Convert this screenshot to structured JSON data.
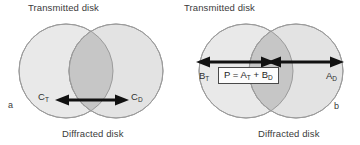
{
  "figure": {
    "width": 360,
    "height": 145,
    "background": "#ffffff"
  },
  "colors": {
    "disk_fill": "#e8e8e8",
    "disk_fill_right": "#e2e2e2",
    "overlap_fill": "#c4c4c4",
    "disk_stroke": "#9a9a9a",
    "arrow": "#111111",
    "text": "#333333",
    "box_border": "#4a4a4a",
    "box_fill": "#fdfdfd"
  },
  "panels": [
    {
      "id": "a",
      "letter": "a",
      "top_label": "Transmitted disk",
      "bottom_label": "Diffracted disk",
      "labels": {
        "left": {
          "base": "C",
          "sub": "T"
        },
        "right": {
          "base": "C",
          "sub": "D"
        }
      },
      "geometry": {
        "left_circle": {
          "cx": 66,
          "cy": 71,
          "r": 47
        },
        "right_circle": {
          "cx": 116,
          "cy": 71,
          "r": 47
        },
        "arrow": {
          "x1": 62,
          "x2": 122,
          "y": 100
        }
      }
    },
    {
      "id": "b",
      "letter": "b",
      "top_label": "Transmitted disk",
      "bottom_label": "Diffracted disk",
      "labels": {
        "left": {
          "base": "B",
          "sub": "T"
        },
        "right": {
          "base": "A",
          "sub": "D"
        }
      },
      "formula": {
        "lhs": "P",
        "eq": "=",
        "term1_base": "A",
        "term1_sub": "T",
        "plus": "+",
        "term2_base": "B",
        "term2_sub": "D"
      },
      "geometry": {
        "left_circle": {
          "cx": 66,
          "cy": 71,
          "r": 47
        },
        "right_circle": {
          "cx": 116,
          "cy": 71,
          "r": 47
        },
        "arrow_left": {
          "x1": 22,
          "x2": 91,
          "y": 62
        },
        "arrow_right": {
          "x1": 93,
          "x2": 160,
          "y": 62
        }
      }
    }
  ]
}
